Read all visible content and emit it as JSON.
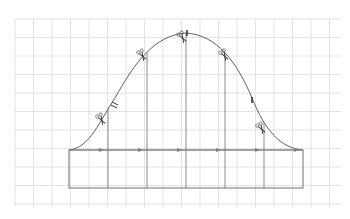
{
  "diagram": {
    "colors": {
      "background": "#ffffff",
      "grid": "#dcdcdc",
      "lines": "#707070",
      "curve": "#606060",
      "arrows": "#808080"
    },
    "grid": {
      "x_start": 15,
      "x_end": 341,
      "y_start": 19,
      "y_end": 207,
      "step": 18.5
    },
    "base_rect": {
      "x": 69,
      "y": 150,
      "width": 234,
      "height": 38
    },
    "dividers_x": [
      108,
      147,
      186,
      225,
      264
    ],
    "arrows_x": [
      103,
      142,
      181,
      220,
      259,
      298
    ],
    "scissors": [
      {
        "x": 101,
        "y": 119,
        "name": "scissors-left-low"
      },
      {
        "x": 142,
        "y": 55,
        "name": "scissors-left-high"
      },
      {
        "x": 182,
        "y": 37,
        "name": "scissors-top"
      },
      {
        "x": 224,
        "y": 55,
        "name": "scissors-right-high"
      },
      {
        "x": 261,
        "y": 128,
        "name": "scissors-right-low"
      }
    ],
    "notches": [
      {
        "type": "double",
        "x": 115,
        "y": 104
      },
      {
        "type": "single",
        "x": 187,
        "y": 33
      },
      {
        "type": "single",
        "x": 252,
        "y": 100
      }
    ]
  }
}
